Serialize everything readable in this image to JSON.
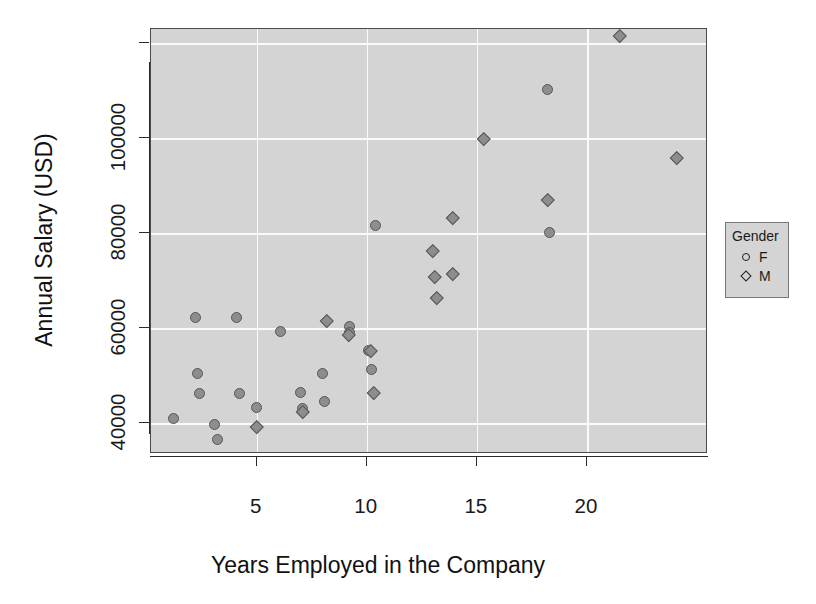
{
  "chart_data": {
    "type": "scatter",
    "title": "",
    "xlabel": "Years Employed in the Company",
    "ylabel": "Annual Salary (USD)",
    "xlim": [
      0.2,
      25.5
    ],
    "ylim": [
      33500,
      123000
    ],
    "xticks": [
      5,
      10,
      15,
      20
    ],
    "yticks": [
      40000,
      60000,
      80000,
      100000
    ],
    "xtick_labels": [
      "5",
      "10",
      "15",
      "20"
    ],
    "ytick_labels": [
      "40000",
      "60000",
      "80000",
      "100000"
    ],
    "grid": true,
    "legend": {
      "title": "Gender",
      "position": "right-outside",
      "entries": [
        {
          "label": "F",
          "marker": "circle"
        },
        {
          "label": "M",
          "marker": "diamond"
        }
      ]
    },
    "series": [
      {
        "name": "F",
        "marker": "circle",
        "points": [
          {
            "x": 1.2,
            "y": 41000
          },
          {
            "x": 2.2,
            "y": 62200
          },
          {
            "x": 2.3,
            "y": 50500
          },
          {
            "x": 2.4,
            "y": 46300
          },
          {
            "x": 3.1,
            "y": 39700
          },
          {
            "x": 3.2,
            "y": 36500
          },
          {
            "x": 4.1,
            "y": 62200
          },
          {
            "x": 4.2,
            "y": 46300
          },
          {
            "x": 5.0,
            "y": 43200
          },
          {
            "x": 6.1,
            "y": 59300
          },
          {
            "x": 7.0,
            "y": 46400
          },
          {
            "x": 7.1,
            "y": 43000
          },
          {
            "x": 8.0,
            "y": 50400
          },
          {
            "x": 8.1,
            "y": 44600
          },
          {
            "x": 9.2,
            "y": 60300
          },
          {
            "x": 9.2,
            "y": 59100
          },
          {
            "x": 10.1,
            "y": 55300
          },
          {
            "x": 10.2,
            "y": 51200
          },
          {
            "x": 10.4,
            "y": 81700
          },
          {
            "x": 18.2,
            "y": 110300
          },
          {
            "x": 18.3,
            "y": 80200
          }
        ]
      },
      {
        "name": "M",
        "marker": "diamond",
        "points": [
          {
            "x": 5.0,
            "y": 39200
          },
          {
            "x": 7.1,
            "y": 42300
          },
          {
            "x": 8.2,
            "y": 61600
          },
          {
            "x": 9.2,
            "y": 58600
          },
          {
            "x": 10.2,
            "y": 55200
          },
          {
            "x": 10.3,
            "y": 46500
          },
          {
            "x": 13.0,
            "y": 76300
          },
          {
            "x": 13.1,
            "y": 70800
          },
          {
            "x": 13.2,
            "y": 66400
          },
          {
            "x": 13.9,
            "y": 71400
          },
          {
            "x": 13.9,
            "y": 83200
          },
          {
            "x": 15.3,
            "y": 99800
          },
          {
            "x": 18.2,
            "y": 87100
          },
          {
            "x": 21.5,
            "y": 121500
          },
          {
            "x": 24.1,
            "y": 95800
          }
        ]
      }
    ]
  }
}
